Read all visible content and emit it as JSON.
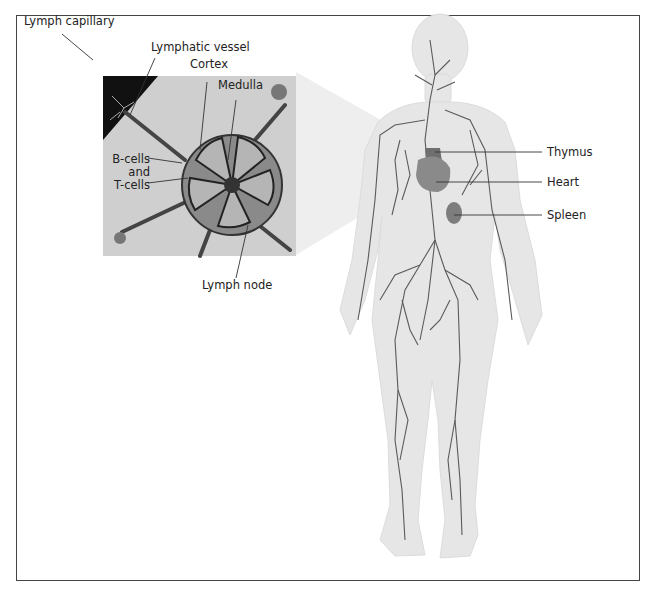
{
  "figure": {
    "top_caption_fragment": "...ymphatic system",
    "inset_subject": "Lymph node cross-section"
  },
  "labels": {
    "lymph_capillary": "Lymph capillary",
    "lymphatic_vessel": "Lymphatic vessel",
    "cortex": "Cortex",
    "medulla": "Medulla",
    "b_cells": "B-cells",
    "and": "and",
    "t_cells": "T-cells",
    "lymph_node": "Lymph node",
    "thymus": "Thymus",
    "heart": "Heart",
    "spleen": "Spleen"
  },
  "colors": {
    "border": "#444444",
    "body_fill": "#e6e6e6",
    "vessel": "#5a5a5a",
    "organ": "#8a8a8a",
    "organ_dark": "#6f6f6f",
    "inset_bg": "#cfcfcf",
    "leader_line": "#333333"
  }
}
